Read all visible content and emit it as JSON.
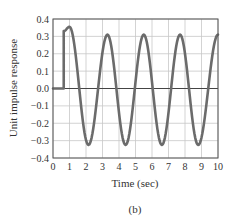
{
  "figure_label": "(b)",
  "chart_data": {
    "type": "line",
    "title": "",
    "xlabel": "Time (sec)",
    "ylabel": "Unit impulse response",
    "xlim": [
      0,
      10
    ],
    "ylim": [
      -0.4,
      0.4
    ],
    "xticks": [
      0,
      1,
      2,
      3,
      4,
      5,
      6,
      7,
      8,
      9,
      10
    ],
    "xtick_labels": [
      "0",
      "1",
      "2",
      "3",
      "4",
      "5",
      "6",
      "7",
      "8",
      "9",
      "10"
    ],
    "yticks": [
      0.4,
      0.3,
      0.2,
      0.1,
      0.0,
      -0.1,
      -0.2,
      -0.3,
      -0.4
    ],
    "ytick_labels": [
      "0.4",
      "0.3",
      "0.2",
      "0.1",
      "0.0",
      "−0.1",
      "−0.2",
      "−0.3",
      "−0.4"
    ],
    "grid": true,
    "legend": null,
    "series": [
      {
        "name": "Unit impulse response",
        "color": "#6b6b6b",
        "description": "Zero until t≈0.65 s, then jumps to ~0.33 and oscillates with period ≈2.2 s; first peak ≈0.355 at t≈1.0, subsequent peaks ≈0.31, troughs ≈−0.325",
        "x": [
          0,
          0.65,
          0.65,
          0.8,
          1.0,
          1.2,
          1.6,
          2.15,
          2.7,
          3.3,
          3.85,
          4.4,
          4.95,
          5.5,
          6.05,
          6.6,
          7.15,
          7.7,
          8.25,
          8.8,
          9.35,
          10.0
        ],
        "y": [
          0,
          0,
          0.33,
          0.35,
          0.355,
          0.33,
          0.0,
          -0.325,
          0.0,
          0.31,
          0.0,
          -0.325,
          0.0,
          0.31,
          0.0,
          -0.325,
          0.0,
          0.31,
          0.0,
          -0.325,
          0.0,
          0.31
        ]
      }
    ],
    "peaks": [
      {
        "t": 1.0,
        "value": 0.355
      },
      {
        "t": 3.3,
        "value": 0.31
      },
      {
        "t": 5.5,
        "value": 0.31
      },
      {
        "t": 7.7,
        "value": 0.31
      },
      {
        "t": 10.0,
        "value": 0.31
      }
    ],
    "troughs": [
      {
        "t": 2.15,
        "value": -0.325
      },
      {
        "t": 4.4,
        "value": -0.325
      },
      {
        "t": 6.6,
        "value": -0.325
      },
      {
        "t": 8.8,
        "value": -0.325
      }
    ],
    "onset_time": 0.65,
    "period_sec": 2.2,
    "colors": {
      "line": "#6b6b6b",
      "grid": "#c8c8c8",
      "frame": "#555555",
      "zero_line": "#444444",
      "text": "#333333"
    }
  }
}
